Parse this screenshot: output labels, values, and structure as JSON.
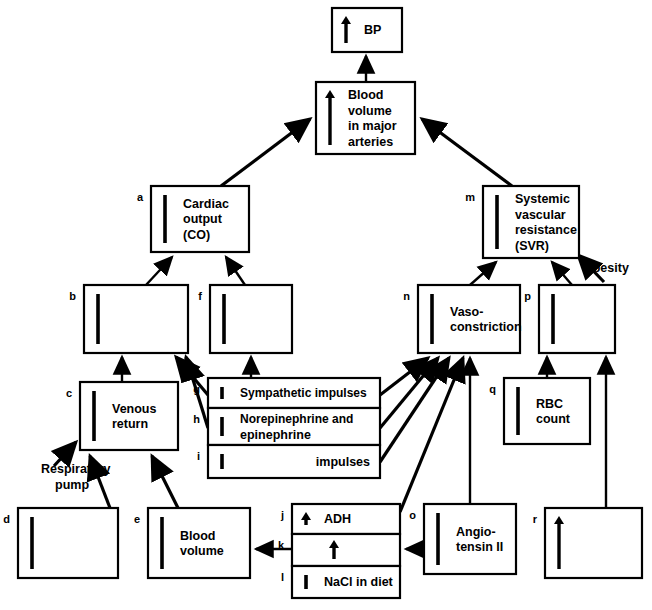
{
  "diagram": {
    "type": "flowchart",
    "colors": {
      "stroke": "#000000",
      "fill": "#ffffff",
      "text": "#000000"
    },
    "nodes": [
      {
        "id": "bp",
        "letter": "",
        "lines": [
          "BP"
        ],
        "marker": "up-arrow",
        "align": "left",
        "x": 332,
        "y": 8,
        "w": 70,
        "h": 44
      },
      {
        "id": "bvma",
        "letter": "",
        "lines": [
          "Blood",
          "volume",
          "in major",
          "arteries"
        ],
        "marker": "up-arrow",
        "align": "left",
        "x": 316,
        "y": 82,
        "w": 99,
        "h": 72
      },
      {
        "id": "co",
        "letter": "a",
        "lines": [
          "Cardiac",
          "output",
          "(CO)"
        ],
        "marker": "bar",
        "align": "left",
        "x": 151,
        "y": 186,
        "w": 98,
        "h": 66
      },
      {
        "id": "svr",
        "letter": "m",
        "lines": [
          "Systemic",
          "vascular",
          "resistance",
          "(SVR)"
        ],
        "marker": "bar",
        "align": "left",
        "x": 483,
        "y": 186,
        "w": 96,
        "h": 72
      },
      {
        "id": "b",
        "letter": "b",
        "lines": [],
        "marker": "bar",
        "align": "left",
        "x": 84,
        "y": 285,
        "w": 104,
        "h": 68
      },
      {
        "id": "f",
        "letter": "f",
        "lines": [],
        "marker": "bar",
        "align": "left",
        "x": 210,
        "y": 285,
        "w": 82,
        "h": 68
      },
      {
        "id": "n",
        "letter": "n",
        "lines": [
          "Vaso-",
          "constriction"
        ],
        "marker": "bar",
        "align": "left",
        "x": 418,
        "y": 285,
        "w": 102,
        "h": 68
      },
      {
        "id": "p",
        "letter": "p",
        "lines": [],
        "marker": "bar",
        "align": "left",
        "x": 539,
        "y": 285,
        "w": 76,
        "h": 68
      },
      {
        "id": "c",
        "letter": "c",
        "lines": [
          "Venous",
          "return"
        ],
        "marker": "bar",
        "align": "left",
        "x": 80,
        "y": 382,
        "w": 98,
        "h": 68
      },
      {
        "id": "g",
        "letter": "g",
        "lines": [
          "Sympathetic impulses"
        ],
        "marker": "bar",
        "align": "left",
        "x": 208,
        "y": 378,
        "w": 172,
        "h": 30
      },
      {
        "id": "h",
        "letter": "h",
        "lines": [
          "Norepinephrine and",
          "epinephrine"
        ],
        "marker": "bar",
        "align": "left",
        "x": 208,
        "y": 408,
        "w": 172,
        "h": 37
      },
      {
        "id": "i",
        "letter": "i",
        "lines": [
          "impulses"
        ],
        "marker": "bar",
        "align": "right",
        "x": 208,
        "y": 445,
        "w": 172,
        "h": 33
      },
      {
        "id": "q",
        "letter": "q",
        "lines": [
          "RBC",
          "count"
        ],
        "marker": "bar",
        "align": "left",
        "x": 504,
        "y": 378,
        "w": 86,
        "h": 66
      },
      {
        "id": "d",
        "letter": "d",
        "lines": [],
        "marker": "bar",
        "align": "left",
        "x": 18,
        "y": 508,
        "w": 100,
        "h": 70
      },
      {
        "id": "e",
        "letter": "e",
        "lines": [
          "Blood",
          "volume"
        ],
        "marker": "bar",
        "align": "left",
        "x": 148,
        "y": 508,
        "w": 102,
        "h": 70
      },
      {
        "id": "j",
        "letter": "j",
        "lines": [
          "ADH"
        ],
        "marker": "up-arrow",
        "align": "left",
        "x": 292,
        "y": 504,
        "w": 108,
        "h": 30
      },
      {
        "id": "k",
        "letter": "k",
        "lines": [],
        "marker": "up-arrow-center",
        "align": "left",
        "x": 292,
        "y": 534,
        "w": 108,
        "h": 32
      },
      {
        "id": "l",
        "letter": "l",
        "lines": [
          "NaCl in diet"
        ],
        "marker": "bar",
        "align": "left",
        "x": 292,
        "y": 566,
        "w": 108,
        "h": 32
      },
      {
        "id": "o",
        "letter": "o",
        "lines": [
          "Angio-",
          "tensin II"
        ],
        "marker": "bar",
        "align": "left",
        "x": 424,
        "y": 504,
        "w": 92,
        "h": 70
      },
      {
        "id": "r",
        "letter": "r",
        "lines": [],
        "marker": "up-arrow",
        "align": "left",
        "x": 545,
        "y": 508,
        "w": 97,
        "h": 70
      }
    ],
    "side_labels": [
      {
        "id": "obesity",
        "text": "Obesity",
        "x": 583,
        "y": 272
      },
      {
        "id": "respiratory-pump",
        "text": "Respiratory",
        "x": 41,
        "y": 473
      },
      {
        "id": "respiratory-pump-2",
        "text": "pump",
        "x": 55,
        "y": 489
      }
    ],
    "edges": [
      {
        "from": "bvma",
        "to": "bp",
        "kind": "vertical"
      },
      {
        "from": "co",
        "to": "bvma",
        "kind": "diagonal"
      },
      {
        "from": "svr",
        "to": "bvma",
        "kind": "diagonal"
      },
      {
        "from": "b",
        "to": "co",
        "kind": "diagonal"
      },
      {
        "from": "f",
        "to": "co",
        "kind": "diagonal"
      },
      {
        "from": "n",
        "to": "svr",
        "kind": "diagonal"
      },
      {
        "from": "p",
        "to": "svr",
        "kind": "diagonal"
      },
      {
        "from": "obesity",
        "to": "svr",
        "kind": "diagonal"
      },
      {
        "from": "c",
        "to": "b",
        "kind": "vertical"
      },
      {
        "from": "g",
        "to": "b",
        "kind": "diagonal"
      },
      {
        "from": "h",
        "to": "b",
        "kind": "diagonal"
      },
      {
        "from": "g",
        "to": "f",
        "kind": "vertical"
      },
      {
        "from": "g",
        "to": "n",
        "kind": "diagonal"
      },
      {
        "from": "h",
        "to": "n",
        "kind": "diagonal"
      },
      {
        "from": "i",
        "to": "n",
        "kind": "diagonal"
      },
      {
        "from": "j",
        "to": "n",
        "kind": "diagonal"
      },
      {
        "from": "q",
        "to": "p",
        "kind": "vertical"
      },
      {
        "from": "r",
        "to": "p",
        "kind": "vertical"
      },
      {
        "from": "d",
        "to": "c",
        "kind": "diagonal"
      },
      {
        "from": "e",
        "to": "c",
        "kind": "diagonal"
      },
      {
        "from": "respiratory-pump",
        "to": "c",
        "kind": "diagonal"
      },
      {
        "from": "j",
        "to": "e",
        "kind": "horizontal"
      },
      {
        "from": "o",
        "to": "k",
        "kind": "horizontal"
      },
      {
        "from": "o",
        "to": "n",
        "kind": "diagonal"
      }
    ]
  }
}
